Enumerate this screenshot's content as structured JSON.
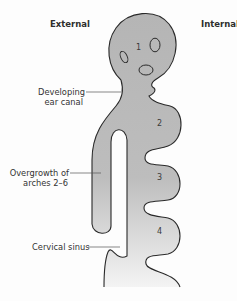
{
  "headers": {
    "left": "External",
    "right": "Internal"
  },
  "labels": {
    "ear_canal_line1": "Developing",
    "ear_canal_line2": "ear canal",
    "overgrowth_line1": "Overgrowth of",
    "overgrowth_line2": "arches 2–6",
    "cervical_sinus": "Cervical sinus"
  },
  "arch_numbers": [
    "1",
    "2",
    "3",
    "4"
  ],
  "colors": {
    "fill": "#b8b8b8",
    "outline": "#2a2a2a",
    "leader": "#555555"
  }
}
